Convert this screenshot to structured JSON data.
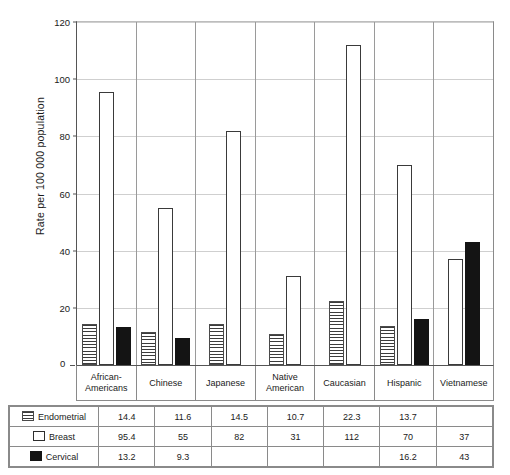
{
  "chart_data": {
    "type": "bar",
    "title": "",
    "xlabel": "",
    "ylabel": "Rate per 100 000 population",
    "ylim": [
      0,
      120
    ],
    "yticks": [
      0,
      20,
      40,
      60,
      80,
      100,
      120
    ],
    "grid": true,
    "legend_position": "table-left",
    "categories": [
      "African-Americans",
      "Chinese",
      "Japanese",
      "Native American",
      "Caucasian",
      "Hispanic",
      "Vietnamese"
    ],
    "series": [
      {
        "name": "Endometrial",
        "swatch": "horizontal-stripes",
        "values": [
          14.4,
          11.6,
          14.5,
          10.7,
          22.3,
          13.7,
          null
        ],
        "labels": [
          "14.4",
          "11.6",
          "14.5",
          "10.7",
          "22.3",
          "13.7",
          ""
        ]
      },
      {
        "name": "Breast",
        "swatch": "white-outline",
        "values": [
          95.4,
          55,
          82,
          31,
          112,
          70,
          37
        ],
        "labels": [
          "95.4",
          "55",
          "82",
          "31",
          "112",
          "70",
          "37"
        ]
      },
      {
        "name": "Cervical",
        "swatch": "solid-black",
        "values": [
          13.2,
          9.3,
          null,
          null,
          null,
          16.2,
          43
        ],
        "labels": [
          "13.2",
          "9.3",
          "",
          "",
          "",
          "16.2",
          "43"
        ]
      }
    ]
  },
  "colors": {
    "endometrial_stripe": "#3c3c3c",
    "breast_outline": "#3a3a3a",
    "cervical_fill": "#141414",
    "gridline": "#cfcfcf",
    "axis": "#555555",
    "table_border": "#8a8a8a"
  },
  "axis": {
    "zero_label": "0"
  }
}
